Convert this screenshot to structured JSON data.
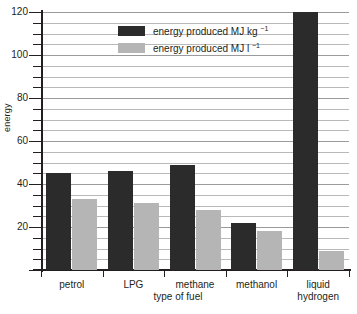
{
  "chart_data": {
    "type": "bar",
    "title": "",
    "xlabel": "type of fuel",
    "ylabel": "energy",
    "categories": [
      "petrol",
      "LPG",
      "methane",
      "methanol",
      "liquid hydrogen"
    ],
    "category_lines": [
      [
        "petrol"
      ],
      [
        "LPG"
      ],
      [
        "methane"
      ],
      [
        "methanol"
      ],
      [
        "liquid",
        "hydrogen"
      ]
    ],
    "series": [
      {
        "name": "energy produced MJ kg⁻¹",
        "name_base": "energy produced MJ kg",
        "name_exponent": "−1",
        "color": "#2b2b2b",
        "values": [
          45,
          46,
          49,
          22,
          120
        ]
      },
      {
        "name": "energy produced MJ l⁻¹",
        "name_base": "energy produced MJ l",
        "name_exponent": "−1",
        "color": "#b5b5b5",
        "values": [
          33,
          31,
          28,
          18,
          9
        ]
      }
    ],
    "ylim": [
      0,
      120
    ],
    "y_major_ticks": [
      0,
      20,
      40,
      60,
      80,
      100,
      120
    ],
    "y_major_labels": [
      "",
      "20",
      "40",
      "60",
      "80",
      "100",
      "120"
    ],
    "y_minor_step": 5,
    "grid": true,
    "legend_position": "top-center"
  },
  "colors": {
    "dark": "#2b2b2b",
    "light": "#b5b5b5",
    "axis": "#231f20",
    "grid": "#b9b9b9",
    "background": "#ffffff"
  }
}
